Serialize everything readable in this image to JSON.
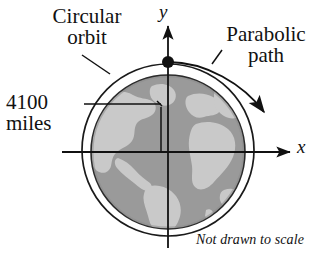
{
  "figure": {
    "note": "Not drawn to scale",
    "labels": {
      "circular_orbit": "Circular\norbit",
      "parabolic_path": "Parabolic\npath",
      "distance": "4100\nmiles",
      "axis_y": "y",
      "axis_x": "x"
    },
    "colors": {
      "ink": "#111111",
      "globe_ocean": "#9a9a9a",
      "globe_land": "#c9c9c9",
      "globe_rim": "#8a8a8a",
      "background": "#ffffff"
    },
    "geometry": {
      "globe_center_x": 168,
      "globe_center_y": 152,
      "globe_radius": 77,
      "orbit_radius": 85,
      "satellite_point_x": 168,
      "satellite_point_y": 62,
      "measurement_value": "4100",
      "measurement_unit": "miles"
    }
  }
}
